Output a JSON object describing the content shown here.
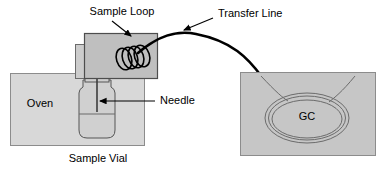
{
  "figure": {
    "type": "schematic-diagram",
    "background_color": "#ffffff",
    "line_color": "#000000"
  },
  "colors": {
    "oven_fill": "#d8d8d8",
    "valve_fill": "#bfbfbf",
    "loop_box_fill": "#cccccc",
    "gc_fill": "#c6c6c6",
    "vial_fill": "#d0d0d0",
    "outline": "#4d4d4d",
    "text": "#000000",
    "transfer_line": "#000000",
    "column_line": "#6b6b6b"
  },
  "labels": {
    "sample_loop": "Sample Loop",
    "transfer_line": "Transfer Line",
    "needle": "Needle",
    "oven": "Oven",
    "sample_vial": "Sample Vial",
    "gc": "GC"
  },
  "components": [
    {
      "name": "oven",
      "label": "Oven",
      "shape": "rectangle",
      "x": 10,
      "y": 73,
      "width": 134,
      "height": 72,
      "fill": "#d8d8d8"
    },
    {
      "name": "valve-block",
      "label": "",
      "shape": "rectangle",
      "x": 84,
      "y": 33,
      "width": 73,
      "height": 45,
      "fill": "#bfbfbf"
    },
    {
      "name": "loop-box",
      "label": "",
      "shape": "rectangle",
      "x": 75,
      "y": 44,
      "width": 62,
      "height": 34,
      "fill": "#cccccc"
    },
    {
      "name": "gas-chromatograph",
      "label": "GC",
      "shape": "rectangle",
      "x": 240,
      "y": 72,
      "width": 135,
      "height": 83,
      "fill": "#c6c6c6"
    },
    {
      "name": "sample-vial",
      "label": "Sample Vial",
      "shape": "vial",
      "x": 75,
      "y": 80,
      "width": 44,
      "height": 60,
      "fill": "#d0d0d0",
      "liquid_level_fraction": 0.45
    },
    {
      "name": "sample-loop-coil",
      "label": "Sample Loop",
      "shape": "helical-coil",
      "turns": 4,
      "center_x": 131,
      "center_y": 58
    },
    {
      "name": "gc-column-coil",
      "label": "",
      "shape": "spiral-coil",
      "turns": 3,
      "center_x": 307,
      "center_y": 118
    },
    {
      "name": "transfer-line",
      "label": "Transfer Line",
      "shape": "curve",
      "from": "sample-loop-coil",
      "to": "gas-chromatograph"
    },
    {
      "name": "needle",
      "label": "Needle",
      "shape": "line",
      "description": "syringe needle passing through vial septum into headspace"
    }
  ],
  "annotations": [
    {
      "name": "sample-loop-callout",
      "text": "Sample Loop",
      "text_x": 122,
      "text_y": 12,
      "arrow_from_x": 100,
      "arrow_from_y": 20,
      "arrow_to_x": 133,
      "arrow_to_y": 38
    },
    {
      "name": "transfer-line-callout",
      "text": "Transfer Line",
      "text_x": 221,
      "text_y": 15,
      "arrow_from_x": 215,
      "arrow_from_y": 21,
      "arrow_to_x": 180,
      "arrow_to_y": 33
    },
    {
      "name": "needle-callout",
      "text": "Needle",
      "text_x": 159,
      "text_y": 101,
      "arrow_from_x": 155,
      "arrow_from_y": 101,
      "arrow_to_x": 99,
      "arrow_to_y": 101
    },
    {
      "name": "oven-label",
      "text": "Oven",
      "text_x": 40,
      "text_y": 104
    },
    {
      "name": "sample-vial-label",
      "text": "Sample Vial",
      "text_x": 98,
      "text_y": 159
    },
    {
      "name": "gc-label",
      "text": "GC",
      "text_x": 307,
      "text_y": 117
    }
  ]
}
